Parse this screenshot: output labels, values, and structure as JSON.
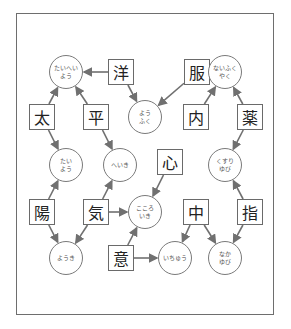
{
  "diagram": {
    "type": "kanji-compound-puzzle",
    "colors": {
      "border": "#6e6e6e",
      "arrow": "#707070",
      "text": "#222222",
      "reading_text": "#555555"
    },
    "kanji": [
      {
        "id": "you",
        "char": "洋",
        "x": 121,
        "y": 72
      },
      {
        "id": "fuku",
        "char": "服",
        "x": 197,
        "y": 72
      },
      {
        "id": "tai",
        "char": "太",
        "x": 42,
        "y": 117
      },
      {
        "id": "hei",
        "char": "平",
        "x": 96,
        "y": 117
      },
      {
        "id": "nai",
        "char": "内",
        "x": 196,
        "y": 117
      },
      {
        "id": "kusuri",
        "char": "薬",
        "x": 250,
        "y": 117
      },
      {
        "id": "kokoro",
        "char": "心",
        "x": 170,
        "y": 162
      },
      {
        "id": "youhi",
        "char": "陽",
        "x": 42,
        "y": 212
      },
      {
        "id": "ki",
        "char": "気",
        "x": 96,
        "y": 212
      },
      {
        "id": "naka",
        "char": "中",
        "x": 196,
        "y": 212
      },
      {
        "id": "yubi",
        "char": "指",
        "x": 250,
        "y": 212
      },
      {
        "id": "i",
        "char": "意",
        "x": 121,
        "y": 258
      }
    ],
    "readings": [
      {
        "id": "taiheiyou",
        "text": "たいへい よう",
        "x": 66,
        "y": 72
      },
      {
        "id": "naifukuyaku",
        "text": "ないふく やく",
        "x": 225,
        "y": 72
      },
      {
        "id": "youfuku",
        "text": "よう ふく",
        "x": 145,
        "y": 117
      },
      {
        "id": "taiyou",
        "text": "たい よう",
        "x": 66,
        "y": 165
      },
      {
        "id": "heiki",
        "text": "へいき",
        "x": 120,
        "y": 165
      },
      {
        "id": "kusuriyubi",
        "text": "くすり ゆび",
        "x": 225,
        "y": 165
      },
      {
        "id": "kokoroiki",
        "text": "こころ いき",
        "x": 145,
        "y": 212
      },
      {
        "id": "youki",
        "text": "ようき",
        "x": 66,
        "y": 258
      },
      {
        "id": "ichuu",
        "text": "いちゅう",
        "x": 175,
        "y": 258
      },
      {
        "id": "nakayubi",
        "text": "なか ゆび",
        "x": 225,
        "y": 258
      }
    ],
    "edges": [
      [
        "you",
        "taiheiyou"
      ],
      [
        "tai",
        "taiheiyou"
      ],
      [
        "hei",
        "taiheiyou"
      ],
      [
        "you",
        "youfuku"
      ],
      [
        "fuku",
        "youfuku"
      ],
      [
        "fuku",
        "naifukuyaku"
      ],
      [
        "nai",
        "naifukuyaku"
      ],
      [
        "kusuri",
        "naifukuyaku"
      ],
      [
        "kusuri",
        "kusuriyubi"
      ],
      [
        "yubi",
        "kusuriyubi"
      ],
      [
        "tai",
        "taiyou"
      ],
      [
        "youhi",
        "taiyou"
      ],
      [
        "hei",
        "heiki"
      ],
      [
        "ki",
        "heiki"
      ],
      [
        "kokoro",
        "kokoroiki"
      ],
      [
        "ki",
        "kokoroiki"
      ],
      [
        "i",
        "kokoroiki"
      ],
      [
        "youhi",
        "youki"
      ],
      [
        "ki",
        "youki"
      ],
      [
        "i",
        "ichuu"
      ],
      [
        "naka",
        "ichuu"
      ],
      [
        "naka",
        "nakayubi"
      ],
      [
        "yubi",
        "nakayubi"
      ]
    ]
  }
}
